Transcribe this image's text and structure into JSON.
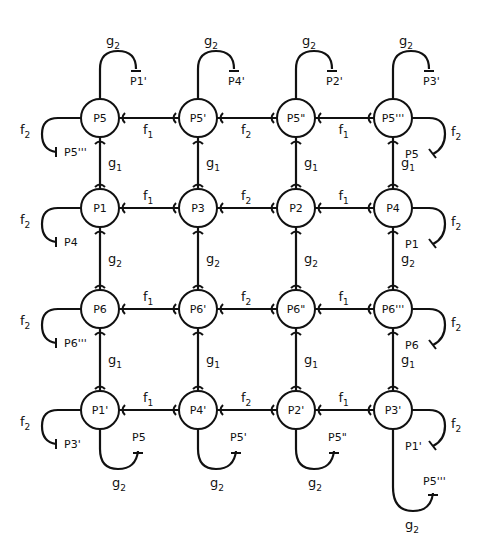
{
  "diagram": {
    "type": "state-transition-grid",
    "columns_x": [
      100,
      198,
      296,
      393
    ],
    "rows_y": [
      118,
      208,
      309,
      410
    ],
    "node_radius": 19,
    "nodes": [
      {
        "id": "P5",
        "label": "P5",
        "row": 0,
        "col": 0
      },
      {
        "id": "P5p",
        "label": "P5'",
        "row": 0,
        "col": 1
      },
      {
        "id": "P5pp",
        "label": "P5\"",
        "row": 0,
        "col": 2
      },
      {
        "id": "P5ppp",
        "label": "P5'''",
        "row": 0,
        "col": 3
      },
      {
        "id": "P1",
        "label": "P1",
        "row": 1,
        "col": 0
      },
      {
        "id": "P3",
        "label": "P3",
        "row": 1,
        "col": 1
      },
      {
        "id": "P2",
        "label": "P2",
        "row": 1,
        "col": 2
      },
      {
        "id": "P4",
        "label": "P4",
        "row": 1,
        "col": 3
      },
      {
        "id": "P6",
        "label": "P6",
        "row": 2,
        "col": 0
      },
      {
        "id": "P6p",
        "label": "P6'",
        "row": 2,
        "col": 1
      },
      {
        "id": "P6pp",
        "label": "P6\"",
        "row": 2,
        "col": 2
      },
      {
        "id": "P6ppp",
        "label": "P6'''",
        "row": 2,
        "col": 3
      },
      {
        "id": "P1p",
        "label": "P1'",
        "row": 3,
        "col": 0
      },
      {
        "id": "P4p",
        "label": "P4'",
        "row": 3,
        "col": 1
      },
      {
        "id": "P2p",
        "label": "P2'",
        "row": 3,
        "col": 2
      },
      {
        "id": "P3p",
        "label": "P3'",
        "row": 3,
        "col": 3
      }
    ],
    "horizontal_edges": [
      {
        "row": 0,
        "between": [
          0,
          1
        ],
        "label": "f",
        "sub": "1"
      },
      {
        "row": 0,
        "between": [
          1,
          2
        ],
        "label": "f",
        "sub": "2"
      },
      {
        "row": 0,
        "between": [
          2,
          3
        ],
        "label": "f",
        "sub": "1"
      },
      {
        "row": 1,
        "between": [
          0,
          1
        ],
        "label": "f",
        "sub": "1"
      },
      {
        "row": 1,
        "between": [
          1,
          2
        ],
        "label": "f",
        "sub": "2"
      },
      {
        "row": 1,
        "between": [
          2,
          3
        ],
        "label": "f",
        "sub": "1"
      },
      {
        "row": 2,
        "between": [
          0,
          1
        ],
        "label": "f",
        "sub": "1"
      },
      {
        "row": 2,
        "between": [
          1,
          2
        ],
        "label": "f",
        "sub": "2"
      },
      {
        "row": 2,
        "between": [
          2,
          3
        ],
        "label": "f",
        "sub": "1"
      },
      {
        "row": 3,
        "between": [
          0,
          1
        ],
        "label": "f",
        "sub": "1"
      },
      {
        "row": 3,
        "between": [
          1,
          2
        ],
        "label": "f",
        "sub": "2"
      },
      {
        "row": 3,
        "between": [
          2,
          3
        ],
        "label": "f",
        "sub": "1"
      }
    ],
    "vertical_edges": [
      {
        "col": 0,
        "between": [
          0,
          1
        ],
        "label": "g",
        "sub": "1"
      },
      {
        "col": 1,
        "between": [
          0,
          1
        ],
        "label": "g",
        "sub": "1"
      },
      {
        "col": 2,
        "between": [
          0,
          1
        ],
        "label": "g",
        "sub": "1"
      },
      {
        "col": 3,
        "between": [
          0,
          1
        ],
        "label": "g",
        "sub": "1"
      },
      {
        "col": 0,
        "between": [
          1,
          2
        ],
        "label": "g",
        "sub": "2"
      },
      {
        "col": 1,
        "between": [
          1,
          2
        ],
        "label": "g",
        "sub": "2"
      },
      {
        "col": 2,
        "between": [
          1,
          2
        ],
        "label": "g",
        "sub": "2"
      },
      {
        "col": 3,
        "between": [
          1,
          2
        ],
        "label": "g",
        "sub": "2"
      },
      {
        "col": 0,
        "between": [
          2,
          3
        ],
        "label": "g",
        "sub": "1"
      },
      {
        "col": 1,
        "between": [
          2,
          3
        ],
        "label": "g",
        "sub": "1"
      },
      {
        "col": 2,
        "between": [
          2,
          3
        ],
        "label": "g",
        "sub": "1"
      },
      {
        "col": 3,
        "between": [
          2,
          3
        ],
        "label": "g",
        "sub": "1"
      }
    ],
    "external_transitions": [
      {
        "from": "P5",
        "label": "g",
        "sub": "2",
        "target": "P1'",
        "side": "top"
      },
      {
        "from": "P5p",
        "label": "g",
        "sub": "2",
        "target": "P4'",
        "side": "top"
      },
      {
        "from": "P5pp",
        "label": "g",
        "sub": "2",
        "target": "P2'",
        "side": "top"
      },
      {
        "from": "P5ppp",
        "label": "g",
        "sub": "2",
        "target": "P3'",
        "side": "top"
      },
      {
        "from": "P5",
        "label": "f",
        "sub": "2",
        "target": "P5'''",
        "side": "left"
      },
      {
        "from": "P5ppp",
        "label": "f",
        "sub": "2",
        "target": "P5",
        "side": "right"
      },
      {
        "from": "P1",
        "label": "f",
        "sub": "2",
        "target": "P4",
        "side": "left"
      },
      {
        "from": "P4",
        "label": "f",
        "sub": "2",
        "target": "P1",
        "side": "right"
      },
      {
        "from": "P6",
        "label": "f",
        "sub": "2",
        "target": "P6'''",
        "side": "left"
      },
      {
        "from": "P6ppp",
        "label": "f",
        "sub": "2",
        "target": "P6",
        "side": "right"
      },
      {
        "from": "P1p",
        "label": "f",
        "sub": "2",
        "target": "P3'",
        "side": "left"
      },
      {
        "from": "P3p",
        "label": "f",
        "sub": "2",
        "target": "P1'",
        "side": "right"
      },
      {
        "from": "P1p",
        "label": "g",
        "sub": "2",
        "target": "P5",
        "side": "bottom"
      },
      {
        "from": "P4p",
        "label": "g",
        "sub": "2",
        "target": "P5'",
        "side": "bottom"
      },
      {
        "from": "P2p",
        "label": "g",
        "sub": "2",
        "target": "P5\"",
        "side": "bottom"
      },
      {
        "from": "P3p",
        "label": "g",
        "sub": "2",
        "target": "P5'''",
        "side": "bottom-long"
      }
    ]
  }
}
